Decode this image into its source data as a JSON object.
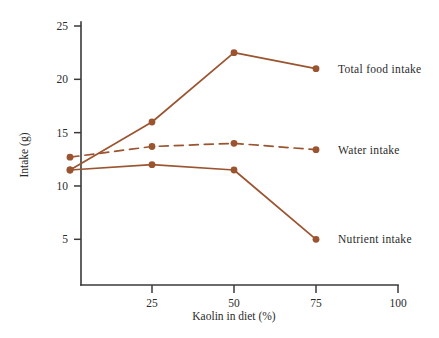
{
  "chart_data": {
    "type": "line",
    "title": "",
    "xlabel": "Kaolin in diet (%)",
    "ylabel": "Intake (g)",
    "x": [
      0,
      25,
      50,
      75
    ],
    "xlim": [
      0,
      100
    ],
    "ylim": [
      0,
      25
    ],
    "xticks": [
      25,
      50,
      75,
      100
    ],
    "xtick_labels": [
      "25",
      "50",
      "75",
      "100"
    ],
    "yticks": [
      5,
      10,
      15,
      20,
      25
    ],
    "ytick_labels": [
      "5",
      "10",
      "15",
      "20",
      "25"
    ],
    "grid": false,
    "legend_position": "right-inline",
    "series": [
      {
        "name": "Total food intake",
        "label": "Total food intake",
        "values": [
          11.5,
          16.0,
          22.5,
          21.0
        ],
        "style": "solid",
        "color": "#9B5430",
        "label_x": 75,
        "label_y": 21.0
      },
      {
        "name": "Water intake",
        "label": "Water intake",
        "values": [
          12.7,
          13.7,
          14.0,
          13.4
        ],
        "style": "dashed",
        "color": "#9B5430",
        "label_x": 75,
        "label_y": 13.4
      },
      {
        "name": "Nutrient intake",
        "label": "Nutrient intake",
        "values": [
          11.5,
          12.0,
          11.5,
          5.0
        ],
        "style": "solid",
        "color": "#9B5430",
        "label_x": 75,
        "label_y": 5.0
      }
    ]
  },
  "colors": {
    "series": "#9B5430",
    "axis": "#3a3a3a",
    "text": "#2b2b2b",
    "background": "#ffffff"
  }
}
